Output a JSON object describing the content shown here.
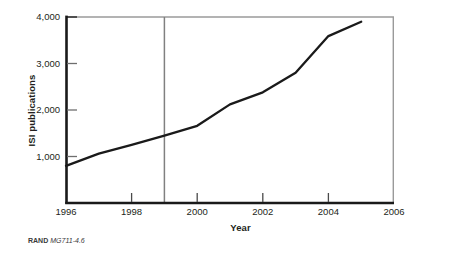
{
  "chart_data": {
    "type": "line",
    "title": "",
    "subtitle": "",
    "xlabel": "Year",
    "ylabel": "ISI publications",
    "xlim": [
      1996,
      2006
    ],
    "ylim": [
      0,
      4000
    ],
    "grid": false,
    "legend": null,
    "x": [
      1996,
      1997,
      1998,
      1999,
      2000,
      2001,
      2002,
      2003,
      2004,
      2005
    ],
    "series": [
      {
        "name": "ISI publications",
        "values": [
          800,
          1060,
          1250,
          1450,
          1660,
          2120,
          2380,
          2800,
          3590,
          3900
        ],
        "color": "#1a1a1a"
      }
    ],
    "x_ticks": [
      1996,
      1998,
      2000,
      2002,
      2004,
      2006
    ],
    "x_tick_labels": [
      "1996",
      "1998",
      "2000",
      "2002",
      "2004",
      "2006"
    ],
    "y_ticks": [
      1000,
      2000,
      3000,
      4000
    ],
    "y_tick_labels": [
      "1,000",
      "2,000",
      "3,000",
      "4,000"
    ],
    "annotations": [
      {
        "type": "vertical-reference-line",
        "x": 1999,
        "color": "#808080",
        "label": ""
      }
    ]
  },
  "footer": {
    "brand": "RAND",
    "document_id": "MG711-4.6"
  },
  "colors": {
    "line": "#1a1a1a",
    "axis": "#1a1a1a",
    "frame": "#9a9a9a",
    "reference_line": "#808080",
    "text": "#231f20",
    "background": "#ffffff"
  }
}
